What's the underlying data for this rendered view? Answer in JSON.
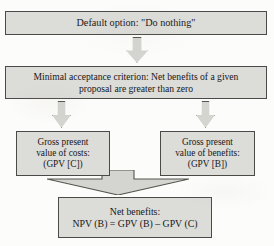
{
  "diagram": {
    "type": "flowchart",
    "orientation": "top-to-bottom",
    "colors": {
      "node_fill": "#dcdcd8",
      "node_border": "#4a4a48",
      "arrow_fill": "#d4d4d0",
      "arrow_border": "#55554f",
      "page_background": "#fcfcfa",
      "text": "#17171a"
    },
    "nodes": [
      {
        "id": "default",
        "label": "Default option: \"Do nothing\"",
        "role": "starting-option"
      },
      {
        "id": "criterion",
        "label": "Minimal acceptance criterion: Net benefits of a given\nproposal are greater than zero",
        "role": "decision-criterion"
      },
      {
        "id": "costs",
        "label": "Gross present\nvalue of costs:\n(GPV [C])",
        "role": "cost-term"
      },
      {
        "id": "benefits",
        "label": "Gross present\nvalue of benefits:\n(GPV [B])",
        "role": "benefit-term"
      },
      {
        "id": "net",
        "label": "Net benefits:\nNPV (B) = GPV (B) – GPV (C)",
        "role": "result-formula"
      }
    ],
    "connectors": [
      {
        "id": "a",
        "from": "default",
        "to": "criterion",
        "shape": "block-down-arrow"
      },
      {
        "id": "b",
        "from": "criterion",
        "to": "costs",
        "shape": "block-down-arrow"
      },
      {
        "id": "c",
        "from": "criterion",
        "to": "benefits",
        "shape": "block-down-arrow"
      },
      {
        "id": "merge",
        "from": "costs-and-benefits",
        "to": "net",
        "shape": "wide-converging-arrow"
      }
    ]
  }
}
